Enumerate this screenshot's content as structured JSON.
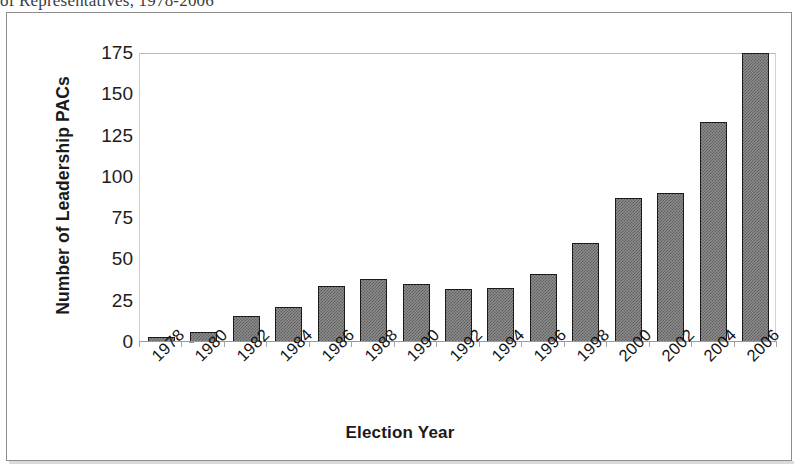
{
  "clipped_caption": "of Representatives, 1978-2006",
  "chart_data": {
    "type": "bar",
    "title": "",
    "xlabel": "Election Year",
    "ylabel": "Number of Leadership PACs",
    "categories": [
      "1978",
      "1980",
      "1982",
      "1984",
      "1986",
      "1988",
      "1990",
      "1992",
      "1994",
      "1996",
      "1998",
      "2000",
      "2002",
      "2004",
      "2006"
    ],
    "values": [
      3,
      6,
      16,
      21,
      34,
      38,
      35,
      32,
      33,
      41,
      60,
      87,
      90,
      133,
      175
    ],
    "ylim": [
      0,
      175
    ],
    "yticks": [
      "0",
      "25",
      "50",
      "75",
      "100",
      "125",
      "150",
      "175"
    ],
    "ytick_values": [
      0,
      25,
      50,
      75,
      100,
      125,
      150,
      175
    ],
    "grid": false,
    "legend": "none",
    "bar_fill_color": "#8d8d8d",
    "bar_border_color": "#1b1b1b",
    "axis_color": "#9a9a9a",
    "background_color": "#ffffff"
  }
}
